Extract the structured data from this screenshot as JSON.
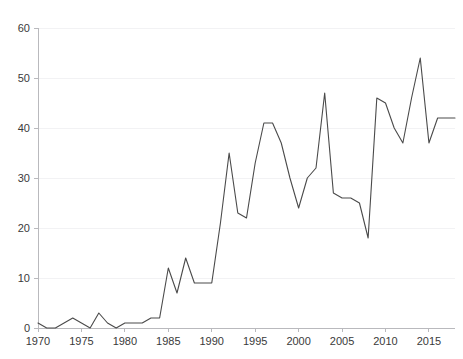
{
  "chart_data": {
    "type": "line",
    "title": "",
    "subtitle": "",
    "xlabel": "",
    "ylabel": "",
    "xlim": [
      1970,
      2018
    ],
    "ylim": [
      0,
      60
    ],
    "grid": true,
    "legend_position": "none",
    "line_color": "#4a4a4a",
    "axis_color": "#b9b9bd",
    "grid_color": "#f2f2f4",
    "label_color": "#3a3a3a",
    "y_ticks": [
      0,
      10,
      20,
      30,
      40,
      50,
      60
    ],
    "y_tick_labels": [
      "0",
      "10",
      "20",
      "30",
      "40",
      "50",
      "60"
    ],
    "x_ticks": [
      1970,
      1975,
      1980,
      1985,
      1990,
      1995,
      2000,
      2005,
      2010,
      2015
    ],
    "x_tick_labels": [
      "1970",
      "1975",
      "1980",
      "1985",
      "1990",
      "1995",
      "2000",
      "2005",
      "2010",
      "2015"
    ],
    "x": [
      1970,
      1971,
      1972,
      1973,
      1974,
      1975,
      1976,
      1977,
      1978,
      1979,
      1980,
      1981,
      1982,
      1983,
      1984,
      1985,
      1986,
      1987,
      1988,
      1989,
      1990,
      1991,
      1992,
      1993,
      1994,
      1995,
      1996,
      1997,
      1998,
      1999,
      2000,
      2001,
      2002,
      2003,
      2004,
      2005,
      2006,
      2007,
      2008,
      2009,
      2010,
      2011,
      2012,
      2013,
      2014,
      2015,
      2016,
      2017,
      2018
    ],
    "values": [
      1,
      0,
      0,
      1,
      2,
      1,
      0,
      3,
      1,
      0,
      1,
      1,
      1,
      2,
      2,
      12,
      7,
      14,
      9,
      9,
      9,
      21,
      35,
      23,
      22,
      33,
      41,
      41,
      37,
      30,
      24,
      30,
      32,
      47,
      27,
      26,
      26,
      25,
      18,
      46,
      45,
      40,
      37,
      46,
      54,
      37,
      42,
      42,
      42
    ],
    "series": [
      {
        "name": "series-1",
        "values": [
          1,
          0,
          0,
          1,
          2,
          1,
          0,
          3,
          1,
          0,
          1,
          1,
          1,
          2,
          2,
          12,
          7,
          14,
          9,
          9,
          9,
          21,
          35,
          23,
          22,
          33,
          41,
          41,
          37,
          30,
          24,
          30,
          32,
          47,
          27,
          26,
          26,
          25,
          18,
          46,
          45,
          40,
          37,
          46,
          54,
          37,
          42,
          42,
          42
        ]
      }
    ]
  },
  "plot": {
    "left": 38,
    "right": 455,
    "top": 28,
    "bottom": 328
  }
}
